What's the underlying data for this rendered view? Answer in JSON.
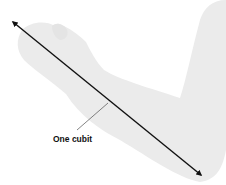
{
  "diagram": {
    "label": "One cubit",
    "colors": {
      "background": "#ffffff",
      "arm": "#ebebeb",
      "arrow": "#111111",
      "leader": "#333333"
    }
  }
}
